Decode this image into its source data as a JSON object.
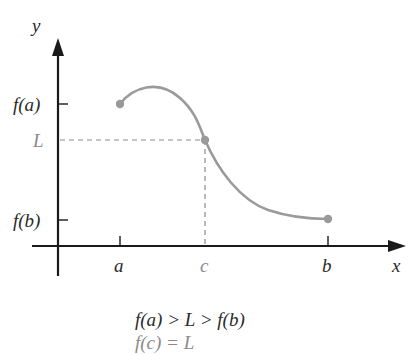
{
  "figure": {
    "axes": {
      "x_label": "x",
      "y_label": "y"
    },
    "y_ticks": [
      {
        "label": "f(a)",
        "y": 104
      },
      {
        "label": "L",
        "y": 140
      },
      {
        "label": "f(b)",
        "y": 220
      }
    ],
    "x_ticks": [
      {
        "label": "a",
        "x": 120
      },
      {
        "label": "c",
        "x": 205
      },
      {
        "label": "b",
        "x": 328
      }
    ],
    "equations": {
      "line1": "f(a) > L > f(b)",
      "line2": "f(c) = L"
    },
    "colors": {
      "axis": "#1a1a1a",
      "curve": "#9a9a9a",
      "dashed": "#8a8a8a",
      "highlight_text": "#8a8a8a"
    }
  }
}
